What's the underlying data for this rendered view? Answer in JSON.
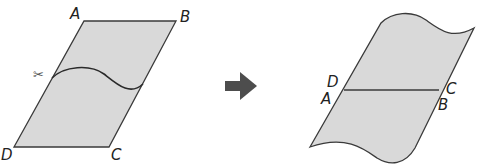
{
  "diagram": {
    "colors": {
      "fill": "#d9d9d9",
      "stroke": "#3a3a3a",
      "arrow": "#4d4d4d"
    },
    "left_figure": {
      "description": "Parallelogram ABCD with a wavy cut line from left side to right side, scissors at left",
      "labels": {
        "A": "A",
        "B": "B",
        "C": "C",
        "D": "D"
      },
      "scissors": "✂"
    },
    "arrow": {
      "direction": "right"
    },
    "right_figure": {
      "description": "Pieces rearranged: bottom piece moved to top so DC joins AB; wavy edges at top and bottom",
      "labels": {
        "D": "D",
        "A": "A",
        "C": "C",
        "B": "B"
      }
    }
  }
}
